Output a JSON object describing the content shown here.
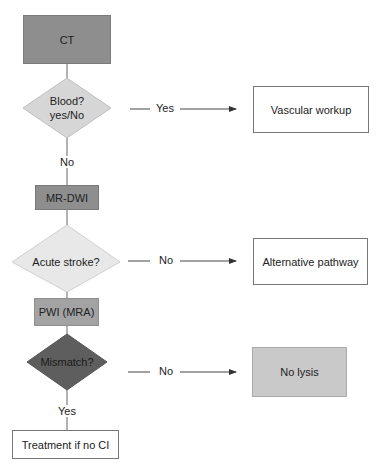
{
  "nodes": {
    "ct": {
      "label": "CT",
      "shape": "rect",
      "fill": "#8e8e8e"
    },
    "blood": {
      "label_line1": "Blood?",
      "label_line2": "yes/No",
      "shape": "diamond",
      "fill": "#d6d6d6"
    },
    "vascular": {
      "label": "Vascular workup",
      "shape": "rect",
      "fill": "#ffffff"
    },
    "mrdwi": {
      "label": "MR-DWI",
      "shape": "rect",
      "fill": "#8e8e8e"
    },
    "acute": {
      "label": "Acute stroke?",
      "shape": "diamond",
      "fill": "#e8e8e8"
    },
    "alternative": {
      "label": "Alternative pathway",
      "shape": "rect",
      "fill": "#ffffff"
    },
    "pwi": {
      "label": "PWI (MRA)",
      "shape": "rect",
      "fill": "#a3a3a3"
    },
    "mismatch": {
      "label": "Mismatch?",
      "shape": "diamond",
      "fill": "#5e5e5e"
    },
    "nolysis": {
      "label": "No lysis",
      "shape": "rect",
      "fill": "#c9c9c9"
    },
    "treatment": {
      "label": "Treatment if no CI",
      "shape": "rect",
      "fill": "#ffffff"
    }
  },
  "edges": {
    "blood_yes": "Yes",
    "blood_no": "No",
    "acute_no": "No",
    "mismatch_no": "No",
    "mismatch_yes": "Yes"
  }
}
